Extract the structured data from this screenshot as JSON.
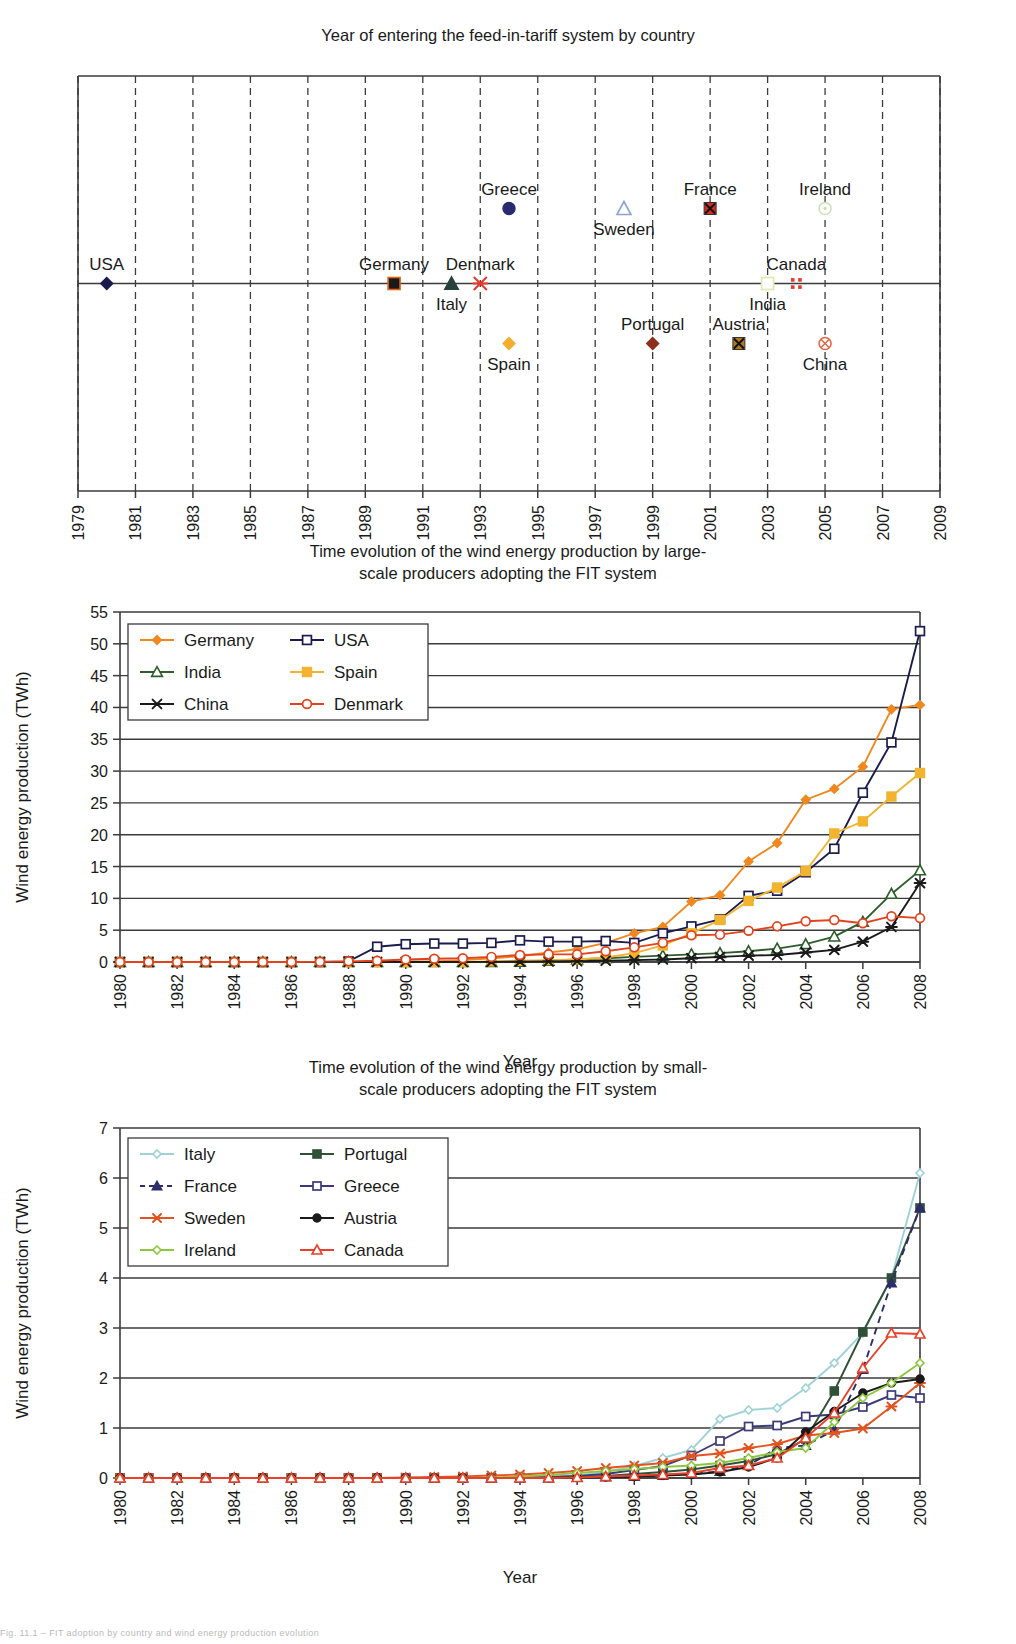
{
  "figure": {
    "footer_note": "Fig. 11.1 – FIT adoption by country and wind energy production evolution"
  },
  "chart1": {
    "title": "Year of entering the feed-in-tariff system by country",
    "x_ticks": [
      "1979",
      "1981",
      "1983",
      "1985",
      "1987",
      "1989",
      "1991",
      "1993",
      "1995",
      "1997",
      "1999",
      "2001",
      "2003",
      "2005",
      "2007",
      "2009"
    ],
    "x_min": 1979,
    "x_max": 2009,
    "points": [
      {
        "country": "USA",
        "year": 1980,
        "level": 0,
        "marker": "diamond",
        "color": "#1b1b4d",
        "label_pos": "left-above"
      },
      {
        "country": "Germany",
        "year": 1990,
        "level": 0,
        "marker": "square",
        "color": "#1a1a1a",
        "edge": "#e2661a",
        "label_pos": "above"
      },
      {
        "country": "Italy",
        "year": 1992,
        "level": 0,
        "marker": "triangle",
        "color": "#27423a",
        "label_pos": "below"
      },
      {
        "country": "Denmark",
        "year": 1993,
        "level": 0,
        "marker": "x",
        "color": "#e23b2e",
        "label_pos": "above"
      },
      {
        "country": "Greece",
        "year": 1994,
        "level": 1,
        "marker": "circle",
        "color": "#2a2a6e",
        "label_pos": "above"
      },
      {
        "country": "Spain",
        "year": 1994,
        "level": -1,
        "marker": "diamond",
        "color": "#f4ae2e",
        "label_pos": "below"
      },
      {
        "country": "Sweden",
        "year": 1998,
        "level": 1,
        "marker": "triangle-open",
        "color": "#8ba3d6",
        "label_pos": "below"
      },
      {
        "country": "Portugal",
        "year": 1999,
        "level": -1,
        "marker": "diamond",
        "color": "#8e2f1e",
        "label_pos": "above"
      },
      {
        "country": "France",
        "year": 2001,
        "level": 1,
        "marker": "x-box",
        "color": "#d62b20",
        "label_pos": "above"
      },
      {
        "country": "Austria",
        "year": 2002,
        "level": -1,
        "marker": "x-box",
        "color": "#b07a1f",
        "label_pos": "above"
      },
      {
        "country": "India",
        "year": 2003,
        "level": 0,
        "marker": "square-open",
        "color": "#dfeab0",
        "label_pos": "below"
      },
      {
        "country": "Canada",
        "year": 2004,
        "level": 0,
        "marker": "dots4",
        "color": "#e03b2c",
        "label_pos": "above"
      },
      {
        "country": "Ireland",
        "year": 2005,
        "level": 1,
        "marker": "circle-dot",
        "color": "#cfe0b8",
        "label_pos": "above"
      },
      {
        "country": "China",
        "year": 2005,
        "level": -1,
        "marker": "circle-x",
        "color": "#e06a4a",
        "label_pos": "below"
      }
    ]
  },
  "chart2": {
    "title_line1": "Time evolution of the wind energy production by large-",
    "title_line2": "scale producers adopting the FIT system",
    "chart_data": {
      "type": "line",
      "title": "Time evolution of the wind energy production by large-scale producers adopting the FIT system",
      "xlabel": "Year",
      "ylabel": "Wind energy production (TWh)",
      "ylim": [
        0,
        55
      ],
      "ytick_step": 5,
      "xlim": [
        1980,
        2008
      ],
      "xtick_step": 2,
      "grid": true,
      "legend_position": "top-left",
      "x": [
        1980,
        1981,
        1982,
        1983,
        1984,
        1985,
        1986,
        1987,
        1988,
        1989,
        1990,
        1991,
        1992,
        1993,
        1994,
        1995,
        1996,
        1997,
        1998,
        1999,
        2000,
        2001,
        2002,
        2003,
        2004,
        2005,
        2006,
        2007,
        2008
      ],
      "series": [
        {
          "name": "Germany",
          "color": "#f0881f",
          "marker": "diamond",
          "values": [
            0,
            0,
            0,
            0,
            0,
            0,
            0,
            0,
            0,
            0,
            0.07,
            0.1,
            0.3,
            0.6,
            0.9,
            1.5,
            2.0,
            3.0,
            4.5,
            5.5,
            9.5,
            10.5,
            15.8,
            18.7,
            25.5,
            27.2,
            30.7,
            39.7,
            40.4
          ]
        },
        {
          "name": "USA",
          "color": "#1b1b4d",
          "marker": "square-open",
          "values": [
            0,
            0,
            0,
            0,
            0,
            0,
            0,
            0,
            0.1,
            2.4,
            2.8,
            2.9,
            2.9,
            3.0,
            3.4,
            3.2,
            3.2,
            3.3,
            3.0,
            4.5,
            5.6,
            6.7,
            10.4,
            11.2,
            14.1,
            17.8,
            26.6,
            34.5,
            52.0
          ]
        },
        {
          "name": "India",
          "color": "#2e5e2b",
          "marker": "triangle-open",
          "values": [
            0,
            0,
            0,
            0,
            0,
            0,
            0,
            0,
            0,
            0,
            0,
            0,
            0,
            0,
            0.03,
            0.2,
            0.4,
            0.6,
            0.8,
            1.0,
            1.2,
            1.4,
            1.7,
            2.1,
            2.8,
            4.0,
            6.3,
            10.7,
            14.4
          ]
        },
        {
          "name": "Spain",
          "color": "#f2b32e",
          "marker": "square",
          "values": [
            0,
            0,
            0,
            0,
            0,
            0,
            0,
            0,
            0,
            0,
            0,
            0,
            0,
            0.1,
            0.2,
            0.3,
            0.4,
            0.7,
            1.4,
            2.6,
            4.5,
            6.6,
            9.6,
            11.7,
            14.3,
            20.2,
            22.1,
            26.0,
            29.7
          ]
        },
        {
          "name": "China",
          "color": "#1a1a1a",
          "marker": "x",
          "values": [
            0,
            0,
            0,
            0,
            0,
            0,
            0,
            0,
            0,
            0,
            0,
            0,
            0,
            0.02,
            0.05,
            0.08,
            0.12,
            0.2,
            0.3,
            0.4,
            0.6,
            0.8,
            1.0,
            1.1,
            1.5,
            1.9,
            3.2,
            5.5,
            12.4
          ]
        },
        {
          "name": "Denmark",
          "color": "#e2431f",
          "marker": "circle-open",
          "values": [
            0,
            0,
            0,
            0,
            0,
            0,
            0,
            0.02,
            0.1,
            0.2,
            0.4,
            0.5,
            0.6,
            0.8,
            1.1,
            1.2,
            1.2,
            1.7,
            2.3,
            3.0,
            4.2,
            4.3,
            4.9,
            5.6,
            6.4,
            6.6,
            6.1,
            7.2,
            6.9
          ]
        }
      ]
    }
  },
  "chart3": {
    "title_line1": "Time evolution of the wind energy production by small-",
    "title_line2": "scale producers adopting the FIT system",
    "chart_data": {
      "type": "line",
      "title": "Time evolution of the wind energy production by small-scale producers adopting the FIT system",
      "xlabel": "Year",
      "ylabel": "Wind energy production (TWh)",
      "ylim": [
        0,
        7
      ],
      "ytick_step": 1,
      "xlim": [
        1980,
        2008
      ],
      "xtick_step": 2,
      "grid": true,
      "legend_position": "top-left",
      "x": [
        1980,
        1981,
        1982,
        1983,
        1984,
        1985,
        1986,
        1987,
        1988,
        1989,
        1990,
        1991,
        1992,
        1993,
        1994,
        1995,
        1996,
        1997,
        1998,
        1999,
        2000,
        2001,
        2002,
        2003,
        2004,
        2005,
        2006,
        2007,
        2008
      ],
      "series": [
        {
          "name": "Italy",
          "color": "#9fd2d8",
          "marker": "diamond-open",
          "values": [
            0,
            0,
            0,
            0,
            0,
            0,
            0,
            0,
            0,
            0,
            0,
            0,
            0,
            0,
            0.01,
            0.02,
            0.05,
            0.12,
            0.24,
            0.4,
            0.56,
            1.18,
            1.36,
            1.4,
            1.8,
            2.3,
            2.9,
            4.0,
            6.1
          ]
        },
        {
          "name": "Portugal",
          "color": "#2f5136",
          "marker": "square",
          "values": [
            0,
            0,
            0,
            0,
            0,
            0,
            0,
            0,
            0,
            0,
            0,
            0,
            0,
            0,
            0,
            0.01,
            0.02,
            0.04,
            0.08,
            0.12,
            0.17,
            0.25,
            0.34,
            0.48,
            0.78,
            1.74,
            2.92,
            4.0,
            5.4
          ]
        },
        {
          "name": "France",
          "color": "#2d2d6b",
          "marker": "triangle",
          "dashed": true,
          "values": [
            0,
            0,
            0,
            0,
            0,
            0,
            0,
            0,
            0,
            0,
            0,
            0,
            0,
            0,
            0,
            0,
            0.01,
            0.02,
            0.03,
            0.05,
            0.08,
            0.13,
            0.25,
            0.6,
            0.65,
            0.96,
            2.17,
            3.9,
            5.4
          ]
        },
        {
          "name": "Greece",
          "color": "#3b3b7a",
          "marker": "square-open",
          "values": [
            0,
            0,
            0,
            0,
            0,
            0,
            0,
            0,
            0,
            0,
            0,
            0,
            0,
            0,
            0.01,
            0.02,
            0.04,
            0.08,
            0.16,
            0.24,
            0.45,
            0.74,
            1.03,
            1.05,
            1.23,
            1.27,
            1.42,
            1.66,
            1.6
          ]
        },
        {
          "name": "Sweden",
          "color": "#e2531f",
          "marker": "x",
          "values": [
            0,
            0,
            0,
            0,
            0,
            0,
            0,
            0,
            0,
            0,
            0.01,
            0.02,
            0.03,
            0.05,
            0.07,
            0.1,
            0.14,
            0.2,
            0.25,
            0.3,
            0.44,
            0.49,
            0.6,
            0.68,
            0.85,
            0.9,
            0.99,
            1.43,
            1.9
          ]
        },
        {
          "name": "Austria",
          "color": "#1a1a1a",
          "marker": "circle",
          "values": [
            0,
            0,
            0,
            0,
            0,
            0,
            0,
            0,
            0,
            0,
            0,
            0,
            0,
            0,
            0,
            0,
            0.01,
            0.02,
            0.03,
            0.05,
            0.07,
            0.12,
            0.22,
            0.4,
            0.92,
            1.33,
            1.7,
            1.9,
            1.98
          ]
        },
        {
          "name": "Ireland",
          "color": "#8dc63f",
          "marker": "diamond-open",
          "values": [
            0,
            0,
            0,
            0,
            0,
            0,
            0,
            0,
            0,
            0,
            0,
            0,
            0,
            0.01,
            0.03,
            0.06,
            0.1,
            0.14,
            0.18,
            0.22,
            0.25,
            0.3,
            0.4,
            0.52,
            0.6,
            1.12,
            1.6,
            1.9,
            2.3
          ]
        },
        {
          "name": "Canada",
          "color": "#e8412a",
          "marker": "triangle-open",
          "values": [
            0,
            0,
            0,
            0,
            0,
            0,
            0,
            0,
            0,
            0,
            0,
            0,
            0,
            0,
            0,
            0,
            0.01,
            0.03,
            0.05,
            0.07,
            0.1,
            0.2,
            0.25,
            0.4,
            0.8,
            1.3,
            2.2,
            2.9,
            2.88
          ]
        }
      ]
    }
  }
}
